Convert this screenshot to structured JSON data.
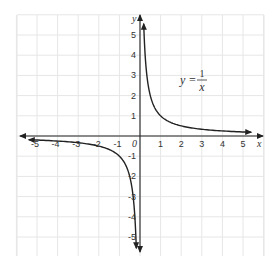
{
  "chart_data": {
    "type": "line",
    "title": "",
    "equation": {
      "lhs": "y =",
      "numerator": "1",
      "denominator": "x"
    },
    "xlabel": "x",
    "ylabel": "y",
    "origin_label": "0",
    "xlim": [
      -5.5,
      5.5
    ],
    "ylim": [
      -5.5,
      5.5
    ],
    "grid": true,
    "x_ticks": [
      -5,
      -4,
      -3,
      -2,
      -1,
      1,
      2,
      3,
      4,
      5
    ],
    "y_ticks": [
      -5,
      -4,
      -3,
      -2,
      -1,
      1,
      2,
      3,
      4,
      5
    ],
    "series": [
      {
        "name": "y = 1/x (x > 0)",
        "x": [
          0.18,
          0.25,
          0.33,
          0.5,
          0.75,
          1,
          1.5,
          2,
          2.5,
          3,
          4,
          5,
          5.4
        ],
        "y": [
          5.5,
          4,
          3,
          2,
          1.33,
          1,
          0.67,
          0.5,
          0.4,
          0.33,
          0.25,
          0.2,
          0.185
        ]
      },
      {
        "name": "y = 1/x (x < 0)",
        "x": [
          -5.4,
          -5,
          -4,
          -3,
          -2.5,
          -2,
          -1.5,
          -1,
          -0.75,
          -0.5,
          -0.33,
          -0.25,
          -0.18
        ],
        "y": [
          -0.185,
          -0.2,
          -0.25,
          -0.33,
          -0.4,
          -0.5,
          -0.67,
          -1,
          -1.33,
          -2,
          -3,
          -4,
          -5.5
        ]
      }
    ],
    "colors": {
      "grid": "#e6e6e6",
      "axis": "#222222",
      "curve": "#222222"
    }
  }
}
